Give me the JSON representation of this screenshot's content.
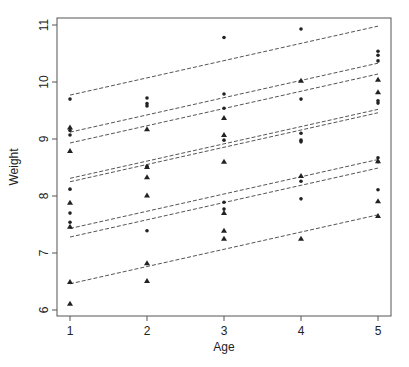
{
  "chart_data": {
    "type": "scatter",
    "title": "",
    "xlabel": "Age",
    "ylabel": "Weight",
    "xlim": [
      0.83,
      5.17
    ],
    "ylim": [
      5.9,
      11.12
    ],
    "x_ticks": [
      1,
      2,
      3,
      4,
      5
    ],
    "y_ticks": [
      6,
      7,
      8,
      9,
      10,
      11
    ],
    "grid": false,
    "legend": null,
    "series": [
      {
        "name": "circles",
        "marker": "circle",
        "points": [
          [
            1,
            9.7
          ],
          [
            1,
            9.15
          ],
          [
            1,
            9.07
          ],
          [
            1,
            8.12
          ],
          [
            1,
            7.7
          ],
          [
            1,
            7.54
          ],
          [
            2,
            9.72
          ],
          [
            2,
            9.62
          ],
          [
            2,
            9.58
          ],
          [
            2,
            8.52
          ],
          [
            2,
            7.39
          ],
          [
            3,
            10.78
          ],
          [
            3,
            9.79
          ],
          [
            3,
            9.54
          ],
          [
            3,
            8.98
          ],
          [
            3,
            7.89
          ],
          [
            3,
            7.77
          ],
          [
            4,
            10.93
          ],
          [
            4,
            9.7
          ],
          [
            4,
            9.1
          ],
          [
            4,
            8.98
          ],
          [
            4,
            8.95
          ],
          [
            4,
            8.26
          ],
          [
            4,
            7.95
          ],
          [
            5,
            10.54
          ],
          [
            5,
            10.47
          ],
          [
            5,
            10.37
          ],
          [
            5,
            9.67
          ],
          [
            5,
            9.63
          ],
          [
            5,
            8.67
          ],
          [
            5,
            8.6
          ],
          [
            5,
            8.11
          ]
        ]
      },
      {
        "name": "triangles",
        "marker": "triangle",
        "points": [
          [
            1,
            9.2
          ],
          [
            1,
            8.79
          ],
          [
            1,
            7.88
          ],
          [
            1,
            7.46
          ],
          [
            1,
            6.49
          ],
          [
            1,
            6.11
          ],
          [
            2,
            9.17
          ],
          [
            2,
            8.51
          ],
          [
            2,
            8.33
          ],
          [
            2,
            8.01
          ],
          [
            2,
            6.82
          ],
          [
            2,
            6.51
          ],
          [
            3,
            9.37
          ],
          [
            3,
            9.07
          ],
          [
            3,
            8.6
          ],
          [
            3,
            7.7
          ],
          [
            3,
            7.39
          ],
          [
            3,
            7.25
          ],
          [
            4,
            10.02
          ],
          [
            4,
            8.35
          ],
          [
            4,
            7.25
          ],
          [
            5,
            10.04
          ],
          [
            5,
            9.82
          ],
          [
            5,
            8.61
          ],
          [
            5,
            7.91
          ],
          [
            5,
            7.65
          ]
        ]
      }
    ],
    "fitted_lines": [
      {
        "style": "dashed",
        "x": [
          1,
          5
        ],
        "y": [
          9.77,
          10.98
        ]
      },
      {
        "style": "dashed",
        "x": [
          1,
          5
        ],
        "y": [
          9.12,
          10.33
        ]
      },
      {
        "style": "dashed",
        "x": [
          1,
          5
        ],
        "y": [
          8.93,
          10.14
        ]
      },
      {
        "style": "dashed",
        "x": [
          1,
          5
        ],
        "y": [
          8.31,
          9.52
        ]
      },
      {
        "style": "dashed",
        "x": [
          1,
          5
        ],
        "y": [
          8.25,
          9.46
        ]
      },
      {
        "style": "dashed",
        "x": [
          1,
          5
        ],
        "y": [
          7.43,
          8.64
        ]
      },
      {
        "style": "dashed",
        "x": [
          1,
          5
        ],
        "y": [
          7.28,
          8.49
        ]
      },
      {
        "style": "dashed",
        "x": [
          1,
          5
        ],
        "y": [
          6.46,
          7.67
        ]
      }
    ]
  },
  "layout": {
    "plot_box": {
      "left": 57,
      "top": 18,
      "right": 391,
      "bottom": 316
    },
    "x_px": {
      "at1": 70,
      "per_unit": 77
    },
    "y_px": {
      "at6": 310,
      "per_unit": 57
    },
    "colors": {
      "axis": "#555555",
      "marker": "#222222",
      "line": "#555555"
    }
  }
}
